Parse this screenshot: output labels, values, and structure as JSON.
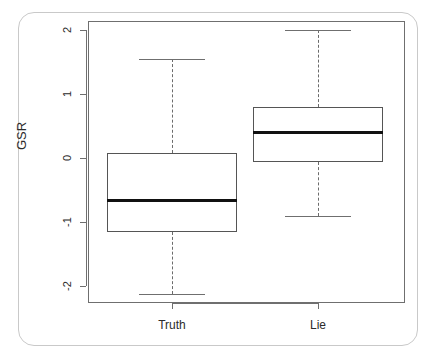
{
  "chart_data": {
    "type": "box",
    "title": "",
    "xlabel": "",
    "ylabel": "GSR",
    "categories": [
      "Truth",
      "Lie"
    ],
    "ylim": [
      -2.25,
      2.2
    ],
    "yticks": [
      -2,
      -1,
      0,
      1,
      2
    ],
    "ytick_labels": [
      "-2",
      "-1",
      "0",
      "1",
      "2"
    ],
    "grid": false,
    "legend": false,
    "boxes": [
      {
        "name": "Truth",
        "whisker_low": -2.13,
        "q1": -1.15,
        "median": -0.67,
        "q3": 0.08,
        "whisker_high": 1.55,
        "outliers": []
      },
      {
        "name": "Lie",
        "whisker_low": -0.9,
        "q1": -0.07,
        "median": 0.4,
        "q3": 0.8,
        "whisker_high": 2.0,
        "outliers": []
      }
    ],
    "style": {
      "box_border_color": "#555555",
      "median_color": "#111111",
      "whisker_color": "#6b6b6b",
      "whisker_style": "dashed",
      "axis_color": "#6f6f6f",
      "background": "#ffffff",
      "card_border_color": "#c9c9c9"
    }
  },
  "axis": {
    "y_title": "GSR",
    "tick_labels": {
      "t0": "2",
      "t1": "1",
      "t2": "0",
      "t3": "-1",
      "t4": "-2"
    },
    "x_labels": {
      "truth": "Truth",
      "lie": "Lie"
    }
  }
}
